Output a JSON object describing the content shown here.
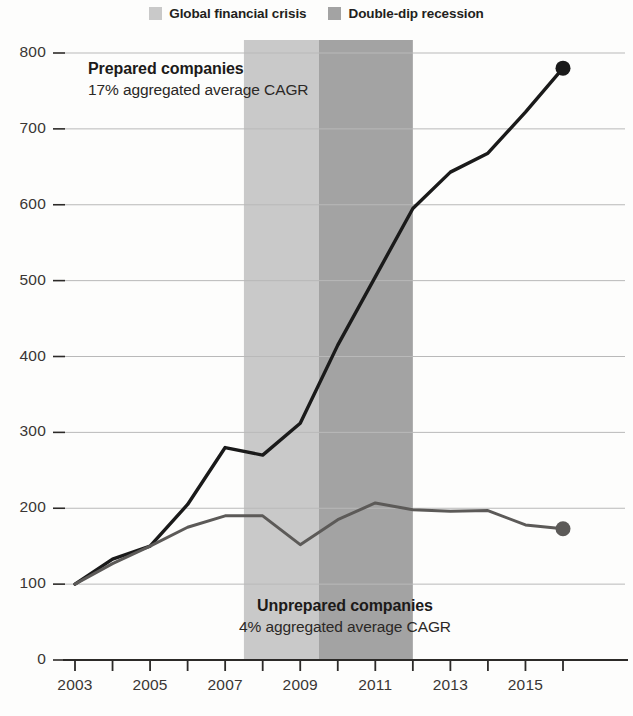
{
  "legend": {
    "items": [
      {
        "label": "Global financial crisis",
        "color": "#c9c9c9",
        "icon": "square-swatch-icon"
      },
      {
        "label": "Double-dip recession",
        "color": "#a3a3a3",
        "icon": "square-swatch-icon"
      }
    ]
  },
  "annotations": {
    "prepared": {
      "title": "Prepared companies",
      "subtitle": "17% aggregated average CAGR"
    },
    "unprepared": {
      "title": "Unprepared companies",
      "subtitle": "4% aggregated average CAGR"
    }
  },
  "chart_data": {
    "type": "line",
    "title": "",
    "xlabel": "",
    "ylabel": "",
    "x": [
      2003,
      2004,
      2005,
      2006,
      2007,
      2008,
      2009,
      2010,
      2011,
      2012,
      2013,
      2014,
      2015,
      2016
    ],
    "xtick_values": [
      2003,
      2004,
      2005,
      2006,
      2007,
      2008,
      2009,
      2010,
      2011,
      2012,
      2013,
      2014,
      2015,
      2016
    ],
    "xtick_labels": [
      "2003",
      "",
      "2005",
      "",
      "2007",
      "",
      "2009",
      "",
      "2011",
      "",
      "2013",
      "",
      "2015",
      ""
    ],
    "xlim": [
      2003,
      2016
    ],
    "ytick_values": [
      0,
      100,
      200,
      300,
      400,
      500,
      600,
      700,
      800
    ],
    "ytick_labels": [
      "0",
      "100",
      "200",
      "300",
      "400",
      "500",
      "600",
      "700",
      "800"
    ],
    "ylim": [
      0,
      800
    ],
    "grid": true,
    "legend_position": "top-center",
    "series": [
      {
        "name": "Prepared companies",
        "color": "#1a1a1a",
        "line_width": 3.4,
        "end_marker": true,
        "values": [
          100,
          133,
          150,
          205,
          280,
          270,
          312,
          415,
          505,
          595,
          643,
          668,
          722,
          780
        ]
      },
      {
        "name": "Unprepared companies",
        "color": "#5c5a58",
        "line_width": 3.0,
        "end_marker": true,
        "values": [
          100,
          127,
          150,
          175,
          190,
          190,
          152,
          185,
          207,
          198,
          196,
          197,
          178,
          173
        ]
      }
    ],
    "shaded_bands": [
      {
        "name": "Global financial crisis",
        "x_start": 2007.5,
        "x_end": 2009.5,
        "color": "#c9c9c9"
      },
      {
        "name": "Double-dip recession",
        "x_start": 2009.5,
        "x_end": 2012.0,
        "color": "#a3a3a3"
      }
    ]
  }
}
